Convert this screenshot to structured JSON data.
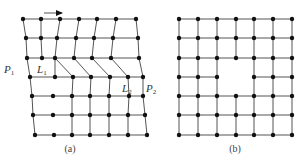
{
  "figure": {
    "panels": [
      {
        "id": "a",
        "caption": "(a)",
        "caption_pos": [
          70,
          152
        ],
        "description": "sheared lattice with dislocations",
        "arrow": {
          "x1": 44,
          "y1": 13,
          "x2": 62,
          "y2": 13,
          "label": "shear-direction"
        },
        "labels": [
          {
            "text": "P",
            "sub": "1",
            "x": 4,
            "y": 73
          },
          {
            "text": "L",
            "sub": "1",
            "x": 37,
            "y": 73
          },
          {
            "text": "L",
            "sub": "2",
            "x": 122,
            "y": 92
          },
          {
            "text": "P",
            "sub": "2",
            "x": 146,
            "y": 92
          }
        ],
        "rows": [
          [
            [
              23,
              19
            ],
            [
              41,
              19
            ],
            [
              60,
              19
            ],
            [
              79,
              19
            ],
            [
              97,
              19
            ],
            [
              116,
              19
            ],
            [
              136,
              19
            ]
          ],
          [
            [
              26,
              38
            ],
            [
              41,
              38
            ],
            [
              57,
              38
            ],
            [
              76,
              38
            ],
            [
              94,
              38
            ],
            [
              113,
              38
            ],
            [
              138,
              38
            ]
          ],
          [
            [
              27,
              58
            ],
            [
              42,
              58
            ],
            [
              55,
              58
            ],
            [
              74,
              58
            ],
            [
              92,
              58
            ],
            [
              111,
              58
            ],
            [
              139,
              58
            ]
          ],
          [
            [
              30,
              77
            ],
            [
              55,
              77
            ],
            [
              73,
              77
            ],
            [
              91,
              77
            ],
            [
              110,
              77
            ],
            [
              128,
              77
            ],
            [
              143,
              77
            ]
          ],
          [
            [
              32,
              96
            ],
            [
              53,
              96
            ],
            [
              72,
              96
            ],
            [
              90,
              96
            ],
            [
              109,
              96
            ],
            [
              129,
              96
            ],
            [
              143,
              96
            ]
          ],
          [
            [
              33,
              115
            ],
            [
              53,
              115
            ],
            [
              72,
              115
            ],
            [
              90,
              115
            ],
            [
              109,
              115
            ],
            [
              128,
              115
            ],
            [
              145,
              115
            ]
          ],
          [
            [
              35,
              135
            ],
            [
              54,
              135
            ],
            [
              72,
              135
            ],
            [
              90,
              135
            ],
            [
              109,
              135
            ],
            [
              128,
              135
            ],
            [
              147,
              135
            ]
          ]
        ]
      },
      {
        "id": "b",
        "caption": "(b)",
        "caption_pos": [
          235,
          152
        ],
        "description": "square lattice with vacancy hole",
        "xs": [
          179,
          198,
          217,
          236,
          254,
          273,
          292
        ],
        "ys": [
          19,
          38,
          58,
          77,
          96,
          115,
          135
        ],
        "missing_node": [
          3,
          3
        ]
      }
    ]
  }
}
